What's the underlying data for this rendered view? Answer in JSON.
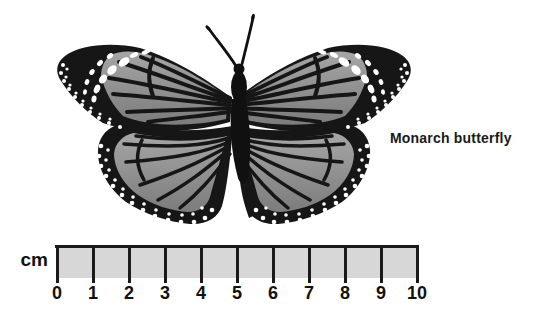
{
  "figure": {
    "subject": "Monarch butterfly",
    "label": "Monarch butterfly"
  },
  "ruler": {
    "unit": "cm",
    "min": 0,
    "max": 10,
    "tick_labels": [
      "0",
      "1",
      "2",
      "3",
      "4",
      "5",
      "6",
      "7",
      "8",
      "9",
      "10"
    ]
  },
  "icons": {
    "butterfly": "butterfly-illustration"
  },
  "colors": {
    "background": "#ffffff",
    "wing_black": "#161616",
    "wing_cell_gray_light": "#a6a6a6",
    "wing_cell_gray_dark": "#7c7c7c",
    "spot_white": "#ffffff",
    "ruler_fill": "#d7d7d7",
    "line_black": "#1a1a1a",
    "text_black": "#111111"
  }
}
